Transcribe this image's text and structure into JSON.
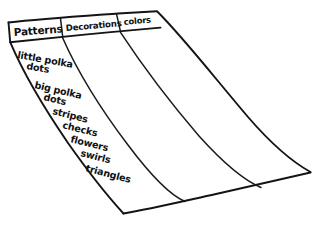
{
  "sketch": {
    "title": "hand-drawn three-column list on a sheet of paper",
    "ink_color": "#141414",
    "paper_color": "#ffffff"
  },
  "table": {
    "headers": [
      {
        "label": "Patterns",
        "column": 1
      },
      {
        "label": "Decorations",
        "column": 2
      },
      {
        "label": "colors",
        "column": 3
      }
    ],
    "columns": [
      {
        "name": "Patterns",
        "items": [
          "little polka",
          "dots",
          "big polka",
          "dots",
          "stripes",
          "checks",
          "flowers",
          "swirls",
          "triangles"
        ]
      },
      {
        "name": "Decorations",
        "items": []
      },
      {
        "name": "colors",
        "items": []
      }
    ]
  },
  "entries": {
    "e1a": "little polka",
    "e1b": "dots",
    "e2a": "big polka",
    "e2b": "dots",
    "e3": "stripes",
    "e4": "checks",
    "e5": "flowers",
    "e6": "swirls",
    "e7": "triangles"
  }
}
